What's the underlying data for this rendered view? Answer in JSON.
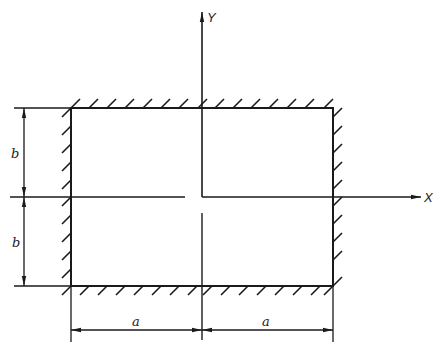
{
  "diagram": {
    "type": "clamped rectangular plate",
    "axes": {
      "x_label": "X",
      "y_label": "Y"
    },
    "dimensions": {
      "half_width_label": "a",
      "half_height_label": "b",
      "width_labels": [
        "a",
        "a"
      ],
      "height_labels": [
        "b",
        "b"
      ]
    },
    "plate": {
      "boundary": "all edges fixed (hatched)",
      "edges": [
        "top",
        "bottom",
        "left",
        "right"
      ]
    },
    "colors": {
      "line": "#1a1a1a",
      "background": "#ffffff"
    }
  }
}
